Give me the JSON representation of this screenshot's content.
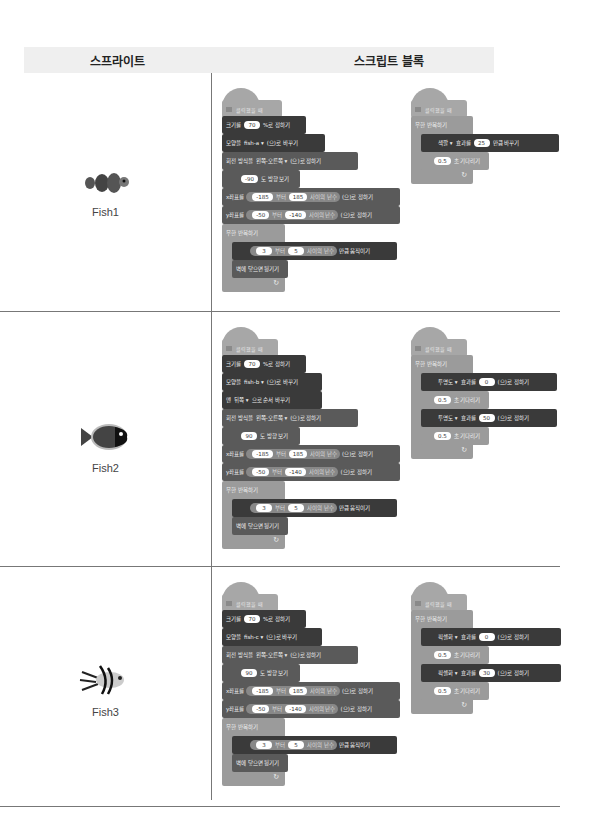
{
  "header": {
    "col_sprite": "스프라이트",
    "col_script": "스크립트 블록"
  },
  "common": {
    "hat": "클릭했을 때",
    "size_pre": "크기를",
    "size_post": "%로 정하기",
    "costume_pre": "모양을",
    "costume_post": "(으)로 바꾸기",
    "rot_pre": "회전 방식을",
    "rot_val": "왼쪽-오른쪽 ▾",
    "rot_post": "(으)로 정하기",
    "dir_post": "도 방향 보기",
    "x_pre": "x좌표를",
    "y_pre": "y좌표를",
    "from": "부터",
    "rand": "사이의 난수",
    "set_post": "(으)로 정하기",
    "forever": "무한 반복하기",
    "move_post": "만큼 움직이기",
    "bounce": "벽에 닿으면 튕기기",
    "wait_post": "초 기다리기",
    "effect": "효과를",
    "change_post": "만큼 바꾸기",
    "loop_arrow": "↻"
  },
  "rows": [
    {
      "sprite": "Fish1",
      "size": "70",
      "costume": "fish-a ▾",
      "dir": "-90",
      "x_from": "-185",
      "x_to": "185",
      "y_from": "-50",
      "y_to": "-140",
      "move_from": "3",
      "move_to": "5",
      "right": {
        "effect": "색깔 ▾",
        "val": "25",
        "wait": "0.5"
      }
    },
    {
      "sprite": "Fish2",
      "size": "70",
      "costume": "fish-b ▾",
      "layer_pre": "맨",
      "layer_val": "뒤쪽 ▾",
      "layer_post": "으로 순서 바꾸기",
      "dir": "90",
      "x_from": "-185",
      "x_to": "185",
      "y_from": "-50",
      "y_to": "-140",
      "move_from": "3",
      "move_to": "5",
      "right": {
        "effect": "투명도 ▾",
        "val1": "0",
        "val2": "50",
        "wait": "0.5"
      }
    },
    {
      "sprite": "Fish3",
      "size": "70",
      "costume": "fish-c ▾",
      "dir": "90",
      "x_from": "-185",
      "x_to": "185",
      "y_from": "-50",
      "y_to": "-140",
      "move_from": "3",
      "move_to": "5",
      "right": {
        "effect": "픽셀화 ▾",
        "val1": "0",
        "val2": "30",
        "wait": "0.5"
      }
    }
  ]
}
